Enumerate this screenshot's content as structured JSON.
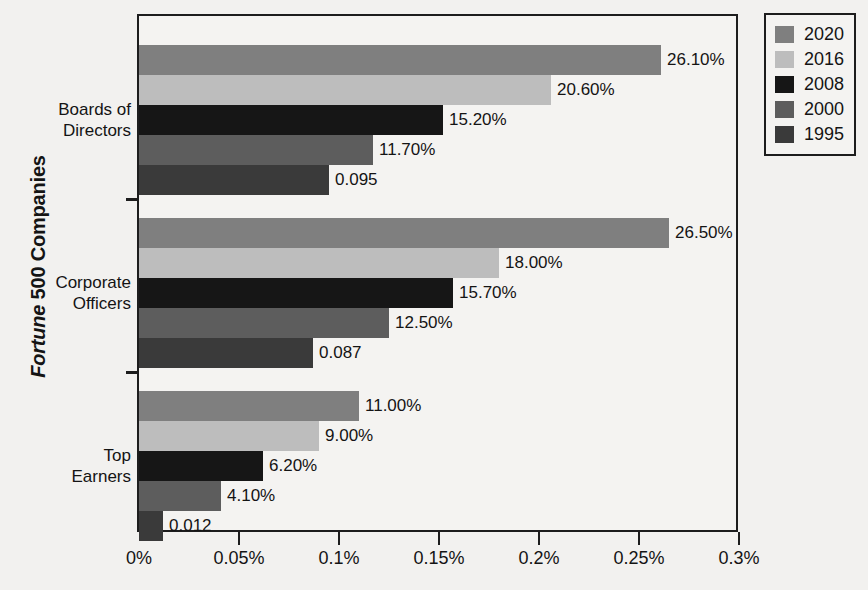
{
  "chart_data": {
    "type": "bar",
    "orientation": "horizontal",
    "title": "",
    "xlabel": "",
    "ylabel": "Fortune 500 Companies",
    "ylabel_italic_part": "Fortune",
    "ylabel_rest": " 500 Companies",
    "categories": [
      "Boards of Directors",
      "Corporate Officers",
      "Top Earners"
    ],
    "category_lines": [
      [
        "Boards of",
        "Directors"
      ],
      [
        "Corporate",
        "Officers"
      ],
      [
        "Top",
        "Earners"
      ]
    ],
    "series": [
      {
        "name": "2020",
        "color": "#7f7f7f",
        "values": [
          0.261,
          0.265,
          0.11
        ],
        "labels": [
          "26.10%",
          "26.50%",
          "11.00%"
        ]
      },
      {
        "name": "2016",
        "color": "#bdbdbd",
        "values": [
          0.206,
          0.18,
          0.09
        ],
        "labels": [
          "20.60%",
          "18.00%",
          "9.00%"
        ]
      },
      {
        "name": "2008",
        "color": "#161616",
        "values": [
          0.152,
          0.157,
          0.062
        ],
        "labels": [
          "15.20%",
          "15.70%",
          "6.20%"
        ]
      },
      {
        "name": "2000",
        "color": "#5d5d5d",
        "values": [
          0.117,
          0.125,
          0.041
        ],
        "labels": [
          "11.70%",
          "12.50%",
          "4.10%"
        ]
      },
      {
        "name": "1995",
        "color": "#3a3a3a",
        "values": [
          0.095,
          0.087,
          0.012
        ],
        "labels": [
          "0.095",
          "0.087",
          "0.012"
        ]
      }
    ],
    "xlim": [
      0,
      0.3
    ],
    "xticks": [
      0,
      0.05,
      0.1,
      0.15,
      0.2,
      0.25,
      0.3
    ],
    "xtick_labels": [
      "0%",
      "0.05%",
      "0.1%",
      "0.15%",
      "0.2%",
      "0.25%",
      "0.3%"
    ],
    "grid": false,
    "legend_position": "top-right",
    "legend_entries": [
      "2020",
      "2016",
      "2008",
      "2000",
      "1995"
    ]
  },
  "colors": {
    "axis": "#1d1d1d",
    "text": "#141414",
    "background": "#f2f1ef",
    "plot_background": "#f4f3f1"
  }
}
